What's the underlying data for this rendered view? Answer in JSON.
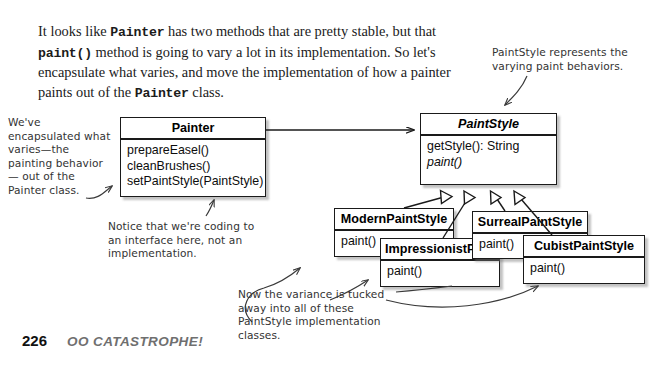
{
  "page": {
    "number": "226",
    "chapter": "OO CATASTROPHE!"
  },
  "intro": {
    "seg1": "It looks like ",
    "code1": "Painter",
    "seg2": " has two methods that are pretty stable, but that ",
    "code2": "paint()",
    "seg3": " method is going to vary a lot in its implementation. So let's encapsulate what varies, and move the implementation of how a painter paints out of the ",
    "code3": "Painter",
    "seg4": " class."
  },
  "diagram": {
    "painter": {
      "name": "Painter",
      "methods": [
        "prepareEasel()",
        "cleanBrushes()",
        "setPaintStyle(PaintStyle)"
      ]
    },
    "paintstyle": {
      "name": "PaintStyle",
      "methods": [
        "getStyle(): String",
        "paint()"
      ]
    },
    "modern": {
      "name": "ModernPaintStyle",
      "methods": [
        "paint()"
      ]
    },
    "impressionist": {
      "name": "ImpressionistPaintStyle",
      "methods": [
        "paint()"
      ]
    },
    "surreal": {
      "name": "SurrealPaintStyle",
      "methods": [
        "paint()"
      ]
    },
    "cubist": {
      "name": "CubistPaintStyle",
      "methods": [
        "paint()"
      ]
    }
  },
  "notes": {
    "left": "We've encapsulated what varies—the painting behavior— out of the Painter class.",
    "topright": "PaintStyle represents the varying paint behaviors.",
    "interface": "Notice that we're coding to an interface here, not an implementation.",
    "variance": "Now the variance is tucked away into all of these PaintStyle implementation classes."
  },
  "colors": {
    "ink": "#1a1a1a",
    "paper": "#ffffff",
    "handwriting": "#333333",
    "footer_chapter": "#6f6f6f"
  }
}
